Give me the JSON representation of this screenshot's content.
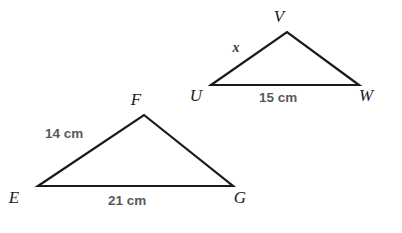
{
  "figure": {
    "background_color": "#ffffff",
    "stroke_color": "#1a1a1a",
    "vertex_label_color": "#1a1a1a",
    "measure_label_color": "#5a5a5a",
    "unknown_label_color": "#3a3a3a",
    "triangles": [
      {
        "name": "triangle-efg",
        "vertices": [
          {
            "label": "E",
            "x": 38,
            "y": 186,
            "label_x": 14,
            "label_y": 203
          },
          {
            "label": "F",
            "x": 144,
            "y": 115,
            "label_x": 136,
            "label_y": 105
          },
          {
            "label": "G",
            "x": 233,
            "y": 186,
            "label_x": 240,
            "label_y": 203
          }
        ],
        "side_labels": [
          {
            "name": "side-ef",
            "text": "14 cm",
            "x": 45,
            "y": 138
          },
          {
            "name": "side-eg",
            "text": "21 cm",
            "x": 108,
            "y": 205
          }
        ]
      },
      {
        "name": "triangle-uvw",
        "vertices": [
          {
            "label": "U",
            "x": 211,
            "y": 85,
            "label_x": 196,
            "label_y": 101
          },
          {
            "label": "V",
            "x": 287,
            "y": 32,
            "label_x": 279,
            "label_y": 22
          },
          {
            "label": "W",
            "x": 359,
            "y": 85,
            "label_x": 366,
            "label_y": 101
          }
        ],
        "side_labels": [
          {
            "name": "side-uv",
            "text": "x",
            "x": 236,
            "y": 52
          },
          {
            "name": "side-uw",
            "text": "15 cm",
            "x": 259,
            "y": 102
          }
        ]
      }
    ]
  }
}
